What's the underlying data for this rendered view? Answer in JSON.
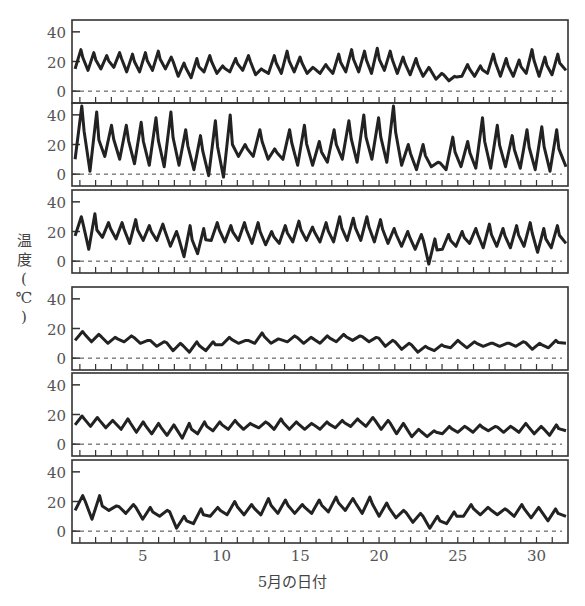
{
  "chart_data": {
    "type": "line",
    "title": "",
    "xlabel": "5月の日付",
    "ylabel": "温度(℃)",
    "ylabel_chars": [
      "温",
      "度",
      "(",
      "℃",
      ")"
    ],
    "xlim": [
      0.5,
      32
    ],
    "ylim": [
      -8,
      48
    ],
    "x_ticks": [
      5,
      10,
      15,
      20,
      25,
      30
    ],
    "y_ticks": [
      0,
      20,
      40
    ],
    "grid": false,
    "zero_line": "dashed",
    "legend": null,
    "panels": [
      {
        "name": "panel-1",
        "peaks": [
          28,
          26,
          24,
          26,
          25,
          26,
          27,
          23,
          19,
          22,
          24,
          17,
          22,
          24,
          15,
          24,
          27,
          23,
          16,
          18,
          25,
          28,
          27,
          29,
          27,
          23,
          22,
          16,
          12,
          10,
          18,
          17,
          25,
          22,
          21,
          28,
          23,
          25
        ],
        "troughs": [
          15,
          14,
          15,
          16,
          13,
          13,
          14,
          15,
          10,
          9,
          13,
          12,
          13,
          14,
          11,
          12,
          12,
          13,
          12,
          12,
          12,
          13,
          13,
          12,
          14,
          12,
          11,
          10,
          8,
          7,
          10,
          10,
          12,
          10,
          10,
          12,
          10,
          11
        ]
      },
      {
        "name": "panel-2",
        "peaks": [
          46,
          42,
          33,
          33,
          35,
          38,
          42,
          30,
          26,
          36,
          40,
          20,
          30,
          17,
          30,
          33,
          22,
          30,
          36,
          40,
          38,
          46,
          20,
          20,
          8,
          25,
          22,
          38,
          33,
          26,
          30,
          32,
          30
        ],
        "troughs": [
          10,
          2,
          12,
          10,
          7,
          6,
          5,
          6,
          3,
          -1,
          -2,
          12,
          12,
          10,
          10,
          6,
          6,
          8,
          10,
          8,
          10,
          8,
          6,
          3,
          5,
          3,
          5,
          4,
          4,
          5,
          4,
          3,
          2
        ]
      },
      {
        "name": "panel-3",
        "peaks": [
          30,
          32,
          26,
          26,
          28,
          24,
          25,
          20,
          24,
          22,
          26,
          24,
          26,
          26,
          20,
          24,
          27,
          23,
          26,
          30,
          29,
          30,
          28,
          22,
          20,
          18,
          15,
          18,
          20,
          22,
          25,
          22,
          24,
          26,
          22,
          24
        ],
        "troughs": [
          17,
          8,
          16,
          15,
          12,
          14,
          14,
          10,
          3,
          5,
          14,
          13,
          14,
          12,
          11,
          12,
          13,
          14,
          13,
          13,
          14,
          14,
          13,
          12,
          10,
          8,
          -2,
          8,
          10,
          12,
          9,
          10,
          9,
          10,
          6,
          9
        ]
      },
      {
        "name": "panel-4",
        "peaks": [
          18,
          16,
          14,
          15,
          12,
          11,
          10,
          11,
          11,
          14,
          12,
          17,
          13,
          15,
          14,
          15,
          16,
          15,
          14,
          12,
          10,
          8,
          9,
          12,
          11,
          10,
          10,
          11,
          10,
          12
        ],
        "troughs": [
          12,
          11,
          10,
          11,
          10,
          8,
          5,
          4,
          5,
          9,
          10,
          10,
          10,
          11,
          10,
          10,
          11,
          12,
          11,
          8,
          6,
          4,
          5,
          7,
          7,
          8,
          8,
          8,
          6,
          7
        ]
      },
      {
        "name": "panel-5",
        "peaks": [
          19,
          18,
          16,
          17,
          15,
          14,
          13,
          14,
          15,
          15,
          16,
          14,
          15,
          17,
          15,
          14,
          15,
          16,
          17,
          18,
          16,
          14,
          10,
          9,
          12,
          12,
          13,
          12,
          12,
          14,
          12,
          13
        ],
        "troughs": [
          13,
          12,
          11,
          10,
          8,
          7,
          6,
          4,
          7,
          9,
          10,
          10,
          11,
          10,
          10,
          10,
          10,
          11,
          12,
          12,
          10,
          7,
          5,
          5,
          7,
          8,
          8,
          9,
          8,
          8,
          7,
          6
        ]
      },
      {
        "name": "panel-6",
        "peaks": [
          24,
          24,
          17,
          18,
          16,
          14,
          10,
          15,
          16,
          20,
          18,
          22,
          21,
          18,
          21,
          23,
          22,
          23,
          19,
          14,
          12,
          10,
          13,
          18,
          16,
          15,
          18,
          16,
          15
        ],
        "troughs": [
          14,
          8,
          14,
          12,
          8,
          10,
          2,
          5,
          10,
          11,
          11,
          11,
          12,
          12,
          12,
          13,
          14,
          12,
          10,
          9,
          6,
          2,
          5,
          10,
          11,
          11,
          10,
          9,
          7
        ]
      }
    ]
  }
}
